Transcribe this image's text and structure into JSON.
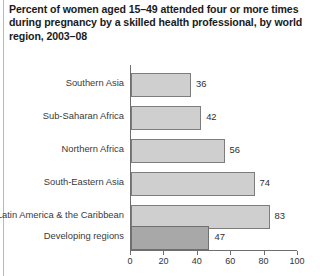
{
  "chart_data": {
    "type": "bar",
    "orientation": "horizontal",
    "title": "Percent of women aged 15–49 attended four or more times during pregnancy by a skilled health professional, by world region, 2003–08",
    "xlabel": "",
    "ylabel": "",
    "xlim": [
      0,
      100
    ],
    "xticks": [
      0,
      20,
      40,
      60,
      80,
      100
    ],
    "xtick_labels": [
      "0",
      "20",
      "40",
      "60",
      "80",
      "100"
    ],
    "grid": false,
    "legend": "none",
    "categories": [
      "Southern Asia",
      "Sub-Saharan Africa",
      "Northern Africa",
      "South-Eastern Asia",
      "Latin America & the Caribbean",
      "Developing regions"
    ],
    "values": [
      36,
      42,
      56,
      74,
      83,
      47
    ],
    "value_labels": [
      "36",
      "42",
      "56",
      "74",
      "83",
      "47"
    ],
    "bar_styles": [
      "light",
      "light",
      "light",
      "light",
      "light",
      "dark"
    ],
    "colors": {
      "bar_light_fill": "#cfcfcf",
      "bar_dark_fill": "#a8a8a8",
      "bar_border": "#7d7d7d",
      "axis": "#6e6e6e",
      "title_text": "#1b1b1b",
      "label_text": "#3a3a3a",
      "background": "#ffffff"
    }
  }
}
